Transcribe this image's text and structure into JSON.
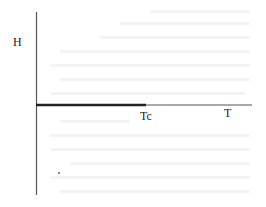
{
  "diagram": {
    "type": "phase-diagram",
    "axes": {
      "vertical_label": "H",
      "horizontal_label": "T"
    },
    "markers": {
      "critical_temperature_label": "Tc"
    },
    "segments": [
      {
        "name": "coexistence-line",
        "from": "T=0",
        "to": "Tc",
        "style": "thick"
      },
      {
        "name": "t-axis-above-tc",
        "from": "Tc",
        "to": "T-axis end",
        "style": "thin"
      }
    ],
    "colors": {
      "axis": "#555555",
      "thick_line": "#222222",
      "thin_line": "#555555",
      "background": "#ffffff",
      "bleed_text": "#f3f3f3"
    }
  }
}
